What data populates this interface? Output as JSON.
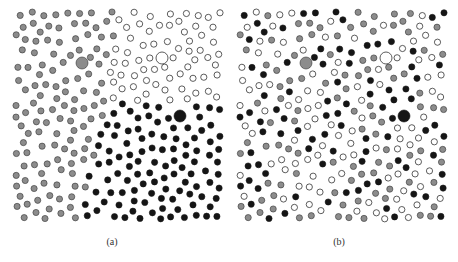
{
  "figure": {
    "panels": [
      {
        "id": "a",
        "caption": "(a)",
        "arrangement": "segregated",
        "regions": {
          "top_left": "gray",
          "top_right": "white",
          "bottom_left": "gray",
          "bottom_right": "black"
        },
        "large_particles": [
          {
            "x": 70,
            "y": 55,
            "type": "gray"
          },
          {
            "x": 150,
            "y": 50,
            "type": "white"
          },
          {
            "x": 168,
            "y": 108,
            "type": "black"
          }
        ]
      },
      {
        "id": "b",
        "caption": "(b)",
        "arrangement": "mixed",
        "large_particles": [
          {
            "x": 70,
            "y": 55,
            "type": "gray"
          },
          {
            "x": 150,
            "y": 50,
            "type": "white"
          },
          {
            "x": 168,
            "y": 108,
            "type": "black"
          }
        ]
      }
    ],
    "colors": {
      "gray": "#8c8c8c",
      "black": "#151515",
      "white": "#ffffff",
      "stroke": "#333333"
    }
  }
}
